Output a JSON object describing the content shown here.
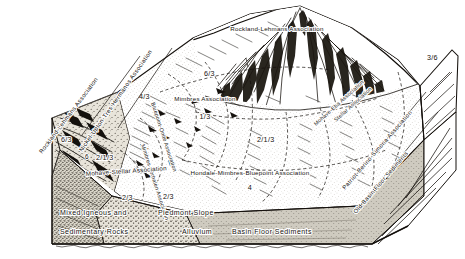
{
  "figure": {
    "type": "block-diagram",
    "background_color": "#ffffff",
    "ink_color": "#15110d"
  },
  "map_units": {
    "mountain_crest": {
      "name": "Rockland-Lehmans Association",
      "code": ""
    },
    "mountain_upper_slope": {
      "name": "",
      "code": "6/3"
    },
    "left_mountain_face": {
      "name": "",
      "code": "6"
    },
    "left_mountain_code": {
      "name": "",
      "code": "6/3"
    },
    "upper_fan": {
      "name": "",
      "code": "4/3"
    },
    "mimbres": {
      "name": "Mimbres Association",
      "code": "1/3"
    },
    "bluepoint_onite": {
      "name": "Bluepoint-Onite Association",
      "code": ""
    },
    "mimbres_verhalen": {
      "name": "Mimbres-Verhalen Association",
      "code": ""
    },
    "mohave_stellar": {
      "name": "Mohave-Stellar Association",
      "code": "2/1/3"
    },
    "hondale": {
      "name": "Hondale-Mimbres-Bluepoint Association",
      "code": "4"
    },
    "mohave_eba": {
      "name": "Mohave-Eba Association",
      "code": ""
    },
    "stellar": {
      "name": "Stellar Association",
      "code": ""
    },
    "right_fan": {
      "name": "",
      "code": "2/1/3"
    },
    "lower_left_fan": {
      "name": "",
      "code": "2/3"
    },
    "lower_center": {
      "name": "",
      "code": "2/3"
    },
    "right_edge_block": {
      "name": "",
      "code": "3/6"
    }
  },
  "side_labels": {
    "left_outer": "Rockland-Lehmans Association",
    "left_inner": "Nickel-Upton-Tres Hermanos Association",
    "right_inner": "Patriot-Berino-Simona Association",
    "right_outer": "Old Basin Floor Sediments"
  },
  "cross_section_legend": [
    {
      "id": "bedrock",
      "line1": "Mixed Igneous and",
      "line2": "Sedimentary Rocks",
      "pattern": "stipple-dark"
    },
    {
      "id": "piedmont",
      "line1": "Piedmont Slope",
      "line2": "Alluvium",
      "pattern": "stipple-coarse"
    },
    {
      "id": "basin",
      "line1": "",
      "line2": "Basin Floor Sediments",
      "pattern": "stipple-light"
    }
  ],
  "codes_list": [
    "6",
    "6/3",
    "4/3",
    "1/3",
    "2/1/3",
    "2/3",
    "4",
    "3/6"
  ]
}
